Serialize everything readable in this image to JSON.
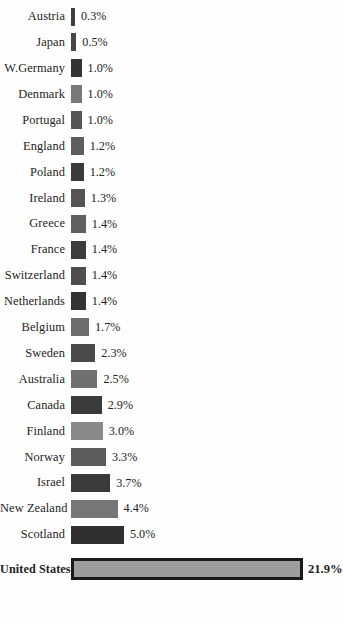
{
  "chart_data": {
    "type": "bar",
    "orientation": "horizontal",
    "title": "",
    "subtitle": "",
    "xlabel": "",
    "ylabel": "",
    "grid": false,
    "legend": null,
    "axis_visible": false,
    "value_suffix": "%",
    "xlim": [
      0,
      21.9
    ],
    "categories": [
      "Austria",
      "Japan",
      "W.Germany",
      "Denmark",
      "Portugal",
      "England",
      "Poland",
      "Ireland",
      "Greece",
      "France",
      "Switzerland",
      "Netherlands",
      "Belgium",
      "Sweden",
      "Australia",
      "Canada",
      "Finland",
      "Norway",
      "Israel",
      "New Zealand",
      "Scotland",
      "United States"
    ],
    "values": [
      0.3,
      0.5,
      1.0,
      1.0,
      1.0,
      1.2,
      1.2,
      1.3,
      1.4,
      1.4,
      1.4,
      1.4,
      1.7,
      2.3,
      2.5,
      2.9,
      3.0,
      3.3,
      3.7,
      4.4,
      5.0,
      21.9
    ],
    "value_labels": [
      "0.3%",
      "0.5%",
      "1.0%",
      "1.0%",
      "1.0%",
      "1.2%",
      "1.2%",
      "1.3%",
      "1.4%",
      "1.4%",
      "1.4%",
      "1.4%",
      "1.7%",
      "2.3%",
      "2.5%",
      "2.9%",
      "3.0%",
      "3.3%",
      "3.7%",
      "4.4%",
      "5.0%",
      "21.9%"
    ],
    "bar_colors": [
      "#3d3d3d",
      "#474747",
      "#343434",
      "#787878",
      "#555555",
      "#5e5e5e",
      "#3a3a3a",
      "#545454",
      "#616161",
      "#3c3c3c",
      "#4e4e4e",
      "#333333",
      "#6e6e6e",
      "#4a4a4a",
      "#707070",
      "#3b3b3b",
      "#8a8a8a",
      "#5c5c5c",
      "#3a3a3a",
      "#767676",
      "#303030",
      "#9d9d9d"
    ],
    "highlight_index": 21,
    "highlight_border_color": "#1a1a1a",
    "background_color": "#fefefe",
    "text_color": "#232323"
  },
  "rows": [
    {
      "label": "Austria",
      "value": "0.3%"
    },
    {
      "label": "Japan",
      "value": "0.5%"
    },
    {
      "label": "W.Germany",
      "value": "1.0%"
    },
    {
      "label": "Denmark",
      "value": "1.0%"
    },
    {
      "label": "Portugal",
      "value": "1.0%"
    },
    {
      "label": "England",
      "value": "1.2%"
    },
    {
      "label": "Poland",
      "value": "1.2%"
    },
    {
      "label": "Ireland",
      "value": "1.3%"
    },
    {
      "label": "Greece",
      "value": "1.4%"
    },
    {
      "label": "France",
      "value": "1.4%"
    },
    {
      "label": "Switzerland",
      "value": "1.4%"
    },
    {
      "label": "Netherlands",
      "value": "1.4%"
    },
    {
      "label": "Belgium",
      "value": "1.7%"
    },
    {
      "label": "Sweden",
      "value": "2.3%"
    },
    {
      "label": "Australia",
      "value": "2.5%"
    },
    {
      "label": "Canada",
      "value": "2.9%"
    },
    {
      "label": "Finland",
      "value": "3.0%"
    },
    {
      "label": "Norway",
      "value": "3.3%"
    },
    {
      "label": "Israel",
      "value": "3.7%"
    },
    {
      "label": "New Zealand",
      "value": "4.4%"
    },
    {
      "label": "Scotland",
      "value": "5.0%"
    },
    {
      "label": "United States",
      "value": "21.9%"
    }
  ]
}
